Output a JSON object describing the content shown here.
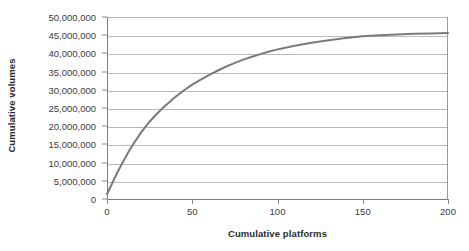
{
  "chart_data": {
    "type": "line",
    "title": "",
    "subtitle": "",
    "xlabel": "Cumulative platforms",
    "ylabel": "Cumulative volumes",
    "xlim": [
      0,
      200
    ],
    "ylim": [
      0,
      50000000
    ],
    "xticks": [
      0,
      50,
      100,
      150,
      200
    ],
    "xtick_labels": [
      "0",
      "50",
      "100",
      "150",
      "200"
    ],
    "yticks": [
      0,
      5000000,
      10000000,
      15000000,
      20000000,
      25000000,
      30000000,
      35000000,
      40000000,
      45000000,
      50000000
    ],
    "ytick_labels": [
      "0",
      "5,000,000",
      "10,000,000",
      "15,000,000",
      "20,000,000",
      "25,000,000",
      "30,000,000",
      "35,000,000",
      "40,000,000",
      "45,000,000",
      "50,000,000"
    ],
    "grid": true,
    "grid_axis": "y",
    "legend": false,
    "legend_position": "none",
    "line_color": "#7a7a7a",
    "line_width": 2,
    "markers": false,
    "series": [
      {
        "name": "Cumulative volumes",
        "x": [
          0,
          2,
          4,
          6,
          8,
          10,
          12,
          14,
          16,
          18,
          20,
          24,
          28,
          32,
          36,
          40,
          45,
          50,
          55,
          60,
          65,
          70,
          75,
          80,
          85,
          90,
          95,
          100,
          110,
          120,
          130,
          140,
          150,
          160,
          170,
          180,
          190,
          200
        ],
        "values": [
          1300000,
          3300000,
          5300000,
          7200000,
          9000000,
          10700000,
          12400000,
          14000000,
          15500000,
          16900000,
          18300000,
          20700000,
          22800000,
          24700000,
          26400000,
          28000000,
          29800000,
          31400000,
          32800000,
          34100000,
          35300000,
          36400000,
          37400000,
          38300000,
          39100000,
          39800000,
          40500000,
          41100000,
          42100000,
          42900000,
          43600000,
          44200000,
          44700000,
          45000000,
          45200000,
          45400000,
          45500000,
          45600000
        ]
      }
    ]
  }
}
